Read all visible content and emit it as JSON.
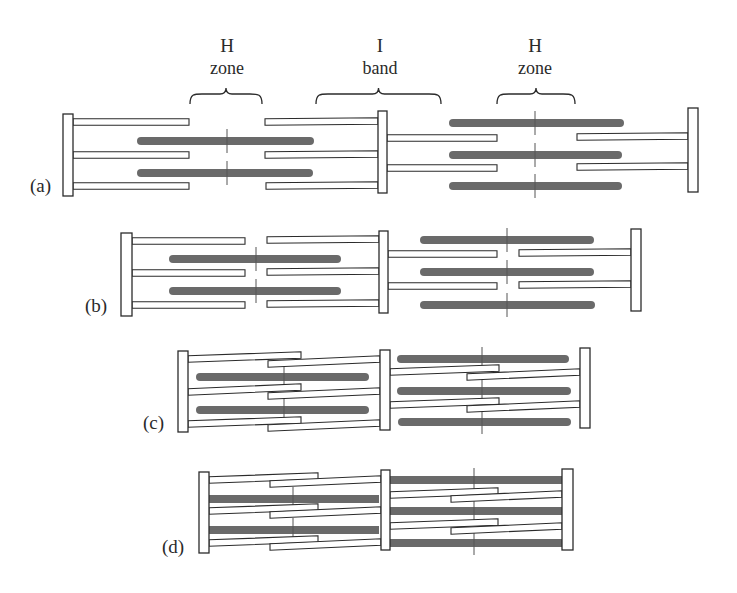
{
  "colors": {
    "thick_filament": "#6a6a6a",
    "outline": "#2b2b2b",
    "background": "#ffffff"
  },
  "annotations": [
    {
      "id": "h-zone-left",
      "line1": "H",
      "line2": "zone",
      "x": 227,
      "y1": 52,
      "y2": 74,
      "brace": {
        "x1": 190,
        "x2": 262,
        "y": 104
      }
    },
    {
      "id": "i-band",
      "line1": "I",
      "line2": "band",
      "x": 380,
      "y1": 52,
      "y2": 74,
      "brace": {
        "x1": 316,
        "x2": 441,
        "y": 104
      }
    },
    {
      "id": "h-zone-right",
      "line1": "H",
      "line2": "zone",
      "x": 535,
      "y1": 52,
      "y2": 74,
      "brace": {
        "x1": 497,
        "x2": 575,
        "y": 104
      }
    }
  ],
  "panels": [
    {
      "label": "(a)",
      "label_pos": {
        "x": 30,
        "y": 192
      },
      "zlines": [
        {
          "x": 63,
          "y": 114,
          "w": 10,
          "h": 82
        },
        {
          "x": 378,
          "y": 111,
          "w": 9,
          "h": 82
        },
        {
          "x": 688,
          "y": 108,
          "w": 10,
          "h": 84
        }
      ],
      "thin": [
        {
          "x1": 73,
          "y1": 122,
          "x2": 189,
          "y2": 122
        },
        {
          "x1": 73,
          "y1": 155,
          "x2": 189,
          "y2": 155
        },
        {
          "x1": 73,
          "y1": 186,
          "x2": 189,
          "y2": 186
        },
        {
          "x1": 265,
          "y1": 122,
          "x2": 378,
          "y2": 121
        },
        {
          "x1": 265,
          "y1": 155,
          "x2": 378,
          "y2": 154
        },
        {
          "x1": 266,
          "y1": 186,
          "x2": 378,
          "y2": 185
        },
        {
          "x1": 387,
          "y1": 138,
          "x2": 497,
          "y2": 138
        },
        {
          "x1": 387,
          "y1": 168,
          "x2": 497,
          "y2": 168
        },
        {
          "x1": 577,
          "y1": 137,
          "x2": 688,
          "y2": 136
        },
        {
          "x1": 577,
          "y1": 167,
          "x2": 688,
          "y2": 166
        }
      ],
      "thick": [
        {
          "x1": 137,
          "x2": 314,
          "y": 141,
          "m": 227
        },
        {
          "x1": 137,
          "x2": 313,
          "y": 173,
          "m": 227
        },
        {
          "x1": 449,
          "x2": 624,
          "y": 123,
          "m": 535
        },
        {
          "x1": 449,
          "x2": 622,
          "y": 155,
          "m": 535
        },
        {
          "x1": 449,
          "x2": 622,
          "y": 186,
          "m": 535
        }
      ],
      "thick_shape": "rounded"
    },
    {
      "label": "(b)",
      "label_pos": {
        "x": 85,
        "y": 312
      },
      "zlines": [
        {
          "x": 121,
          "y": 233,
          "w": 11,
          "h": 83
        },
        {
          "x": 379,
          "y": 231,
          "w": 9,
          "h": 82
        },
        {
          "x": 631,
          "y": 229,
          "w": 10,
          "h": 82
        }
      ],
      "thin": [
        {
          "x1": 132,
          "y1": 241,
          "x2": 245,
          "y2": 241
        },
        {
          "x1": 132,
          "y1": 273,
          "x2": 245,
          "y2": 273
        },
        {
          "x1": 132,
          "y1": 305,
          "x2": 245,
          "y2": 305
        },
        {
          "x1": 267,
          "y1": 240,
          "x2": 379,
          "y2": 239
        },
        {
          "x1": 267,
          "y1": 272,
          "x2": 379,
          "y2": 271
        },
        {
          "x1": 267,
          "y1": 304,
          "x2": 379,
          "y2": 303
        },
        {
          "x1": 388,
          "y1": 254,
          "x2": 497,
          "y2": 254
        },
        {
          "x1": 388,
          "y1": 286,
          "x2": 497,
          "y2": 286
        },
        {
          "x1": 519,
          "y1": 253,
          "x2": 631,
          "y2": 252
        },
        {
          "x1": 519,
          "y1": 285,
          "x2": 631,
          "y2": 284
        }
      ],
      "thick": [
        {
          "x1": 169,
          "x2": 341,
          "y": 259,
          "m": 256
        },
        {
          "x1": 169,
          "x2": 341,
          "y": 291,
          "m": 256
        },
        {
          "x1": 420,
          "x2": 594,
          "y": 240,
          "m": 507
        },
        {
          "x1": 420,
          "x2": 594,
          "y": 272,
          "m": 507
        },
        {
          "x1": 420,
          "x2": 595,
          "y": 305,
          "m": 507
        }
      ],
      "thick_shape": "rounded"
    },
    {
      "label": "(c)",
      "label_pos": {
        "x": 143,
        "y": 429
      },
      "zlines": [
        {
          "x": 178,
          "y": 351,
          "w": 10,
          "h": 81
        },
        {
          "x": 380,
          "y": 350,
          "w": 10,
          "h": 80
        },
        {
          "x": 580,
          "y": 348,
          "w": 10,
          "h": 80
        }
      ],
      "thin": [
        {
          "x1": 188,
          "y1": 359,
          "x2": 301,
          "y2": 355
        },
        {
          "x1": 188,
          "y1": 392,
          "x2": 301,
          "y2": 387
        },
        {
          "x1": 188,
          "y1": 424,
          "x2": 301,
          "y2": 420
        },
        {
          "x1": 268,
          "y1": 364,
          "x2": 380,
          "y2": 359
        },
        {
          "x1": 268,
          "y1": 396,
          "x2": 380,
          "y2": 391
        },
        {
          "x1": 268,
          "y1": 428,
          "x2": 380,
          "y2": 423
        },
        {
          "x1": 390,
          "y1": 372,
          "x2": 499,
          "y2": 368
        },
        {
          "x1": 390,
          "y1": 405,
          "x2": 499,
          "y2": 401
        },
        {
          "x1": 467,
          "y1": 377,
          "x2": 580,
          "y2": 372
        },
        {
          "x1": 467,
          "y1": 409,
          "x2": 580,
          "y2": 404
        }
      ],
      "thick": [
        {
          "x1": 196,
          "x2": 369,
          "y": 377,
          "m": 284
        },
        {
          "x1": 196,
          "x2": 369,
          "y": 410,
          "m": 284
        },
        {
          "x1": 397,
          "x2": 569,
          "y": 359,
          "m": 482
        },
        {
          "x1": 397,
          "x2": 571,
          "y": 391,
          "m": 482
        },
        {
          "x1": 398,
          "x2": 571,
          "y": 422,
          "m": 482
        }
      ],
      "thick_shape": "rounded"
    },
    {
      "label": "(d)",
      "label_pos": {
        "x": 162,
        "y": 553
      },
      "zlines": [
        {
          "x": 199,
          "y": 472,
          "w": 10,
          "h": 81
        },
        {
          "x": 381,
          "y": 470,
          "w": 9,
          "h": 80
        },
        {
          "x": 562,
          "y": 469,
          "w": 11,
          "h": 81
        }
      ],
      "thin": [
        {
          "x1": 209,
          "y1": 480,
          "x2": 318,
          "y2": 476
        },
        {
          "x1": 209,
          "y1": 511,
          "x2": 318,
          "y2": 507
        },
        {
          "x1": 209,
          "y1": 543,
          "x2": 318,
          "y2": 539
        },
        {
          "x1": 270,
          "y1": 484,
          "x2": 381,
          "y2": 479
        },
        {
          "x1": 270,
          "y1": 515,
          "x2": 381,
          "y2": 510
        },
        {
          "x1": 270,
          "y1": 547,
          "x2": 381,
          "y2": 542
        },
        {
          "x1": 390,
          "y1": 495,
          "x2": 498,
          "y2": 491
        },
        {
          "x1": 390,
          "y1": 526,
          "x2": 498,
          "y2": 522
        },
        {
          "x1": 451,
          "y1": 499,
          "x2": 562,
          "y2": 494
        },
        {
          "x1": 451,
          "y1": 531,
          "x2": 562,
          "y2": 526
        }
      ],
      "thick": [
        {
          "x1": 209,
          "x2": 379,
          "y": 499,
          "m": 293
        },
        {
          "x1": 209,
          "x2": 379,
          "y": 530,
          "m": 293
        },
        {
          "x1": 390,
          "x2": 562,
          "y": 480,
          "m": 474
        },
        {
          "x1": 390,
          "x2": 562,
          "y": 511,
          "m": 474
        },
        {
          "x1": 390,
          "x2": 562,
          "y": 543,
          "m": 474
        }
      ],
      "thick_shape": "flat"
    }
  ]
}
